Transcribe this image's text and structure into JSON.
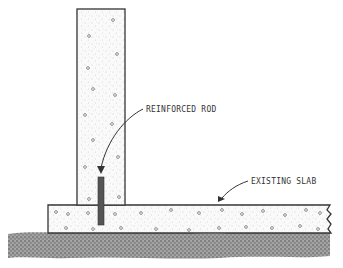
{
  "diagram": {
    "type": "construction-detail",
    "labels": {
      "rod": "REINFORCED ROD",
      "slab": "EXISTING SLAB"
    },
    "colors": {
      "ink": "#333333",
      "concrete_fill": "#f7f7f7",
      "ground": "#555555",
      "rod": "#555555",
      "background": "#ffffff"
    }
  }
}
